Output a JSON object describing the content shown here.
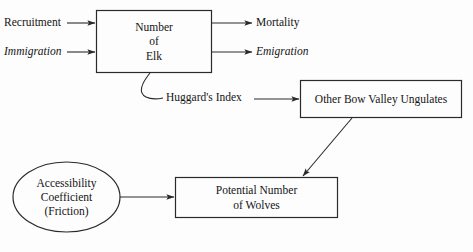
{
  "diagram": {
    "background_color": "#fdfdfd",
    "line_color": "#2a2a2a",
    "text_color": "#141414",
    "nodes": [
      {
        "id": "elk",
        "shape": "rectangle",
        "lines": [
          "Number",
          "of",
          "Elk"
        ],
        "x": 96,
        "y": 10,
        "w": 116,
        "h": 63
      },
      {
        "id": "ungulates",
        "shape": "rectangle",
        "lines": [
          "Other Bow Valley Ungulates"
        ],
        "x": 300,
        "y": 80,
        "w": 162,
        "h": 38
      },
      {
        "id": "wolves",
        "shape": "rectangle",
        "lines": [
          "Potential Number",
          "of Wolves"
        ],
        "x": 175,
        "y": 177,
        "w": 163,
        "h": 41
      },
      {
        "id": "accessibility",
        "shape": "ellipse",
        "lines": [
          "Accessibility",
          "Coefficient",
          "(Friction)"
        ],
        "x": 13,
        "y": 162,
        "w": 107,
        "h": 70
      }
    ],
    "edge_labels": [
      {
        "id": "recruitment",
        "text": "Recruitment",
        "italic": false,
        "x": 4,
        "y": 17
      },
      {
        "id": "immigration",
        "text": "Immigration",
        "italic": true,
        "x": 4,
        "y": 46
      },
      {
        "id": "mortality",
        "text": "Mortality",
        "italic": false,
        "x": 256,
        "y": 17
      },
      {
        "id": "emigration",
        "text": "Emigration",
        "italic": true,
        "x": 256,
        "y": 46
      },
      {
        "id": "huggards-index",
        "text": "Huggard's Index",
        "italic": false,
        "x": 166,
        "y": 92
      }
    ],
    "arrows": [
      {
        "id": "recruitment-to-elk",
        "kind": "straight",
        "from_label": "Recruitment",
        "to_node": "elk"
      },
      {
        "id": "immigration-to-elk",
        "kind": "straight",
        "from_label": "Immigration",
        "to_node": "elk"
      },
      {
        "id": "elk-to-mortality",
        "kind": "straight",
        "from_node": "elk",
        "to_label": "Mortality"
      },
      {
        "id": "elk-to-emigration",
        "kind": "straight",
        "from_node": "elk",
        "to_label": "Emigration"
      },
      {
        "id": "elk-to-huggards-index",
        "kind": "curve",
        "from_node": "elk",
        "to_label": "Huggard's Index",
        "arrowhead": false
      },
      {
        "id": "huggards-index-to-ungulates",
        "kind": "straight",
        "from_label": "Huggard's Index",
        "to_node": "ungulates"
      },
      {
        "id": "ungulates-to-wolves",
        "kind": "diagonal",
        "from_node": "ungulates",
        "to_node": "wolves"
      },
      {
        "id": "accessibility-to-wolves",
        "kind": "straight",
        "from_node": "accessibility",
        "to_node": "wolves"
      }
    ]
  }
}
